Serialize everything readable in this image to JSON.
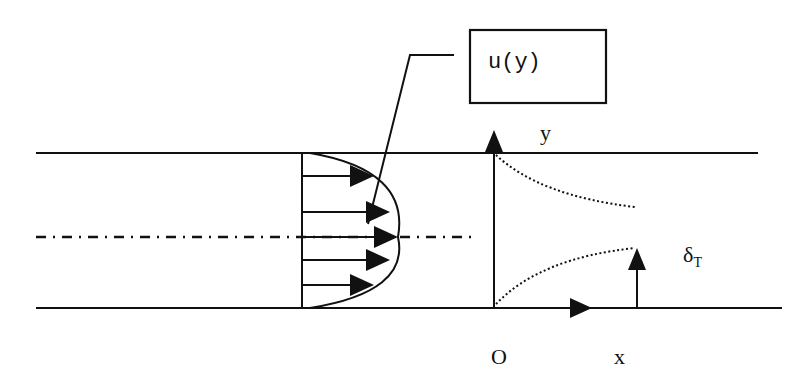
{
  "diagram": {
    "type": "channel-flow-thermal-boundary-layer",
    "labels": {
      "velocity_profile": "u(y)",
      "y_axis": "y",
      "x_axis": "x",
      "origin": "O",
      "thermal_bl_symbol": "δ",
      "thermal_bl_subscript": "T"
    },
    "elements": {
      "walls": [
        "top-wall",
        "bottom-wall"
      ],
      "centerline": "dash-dot",
      "velocity_arrows_count": 5,
      "thermal_boundary_layer_curves": [
        "upper-dotted",
        "lower-dotted"
      ]
    },
    "colors": {
      "ink": "#111111",
      "background": "#ffffff"
    }
  }
}
